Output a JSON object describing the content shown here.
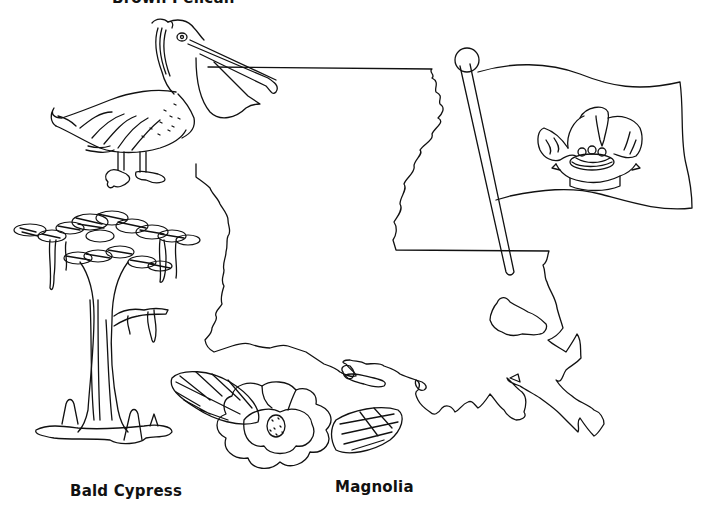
{
  "labels": {
    "bird": "Brown Pelican",
    "tree": "Bald Cypress",
    "flower": "Magnolia"
  },
  "illustrations": [
    {
      "name": "brown-pelican",
      "description": "Line drawing of a standing brown pelican with long bill"
    },
    {
      "name": "louisiana-map",
      "description": "Outline map of the state of Louisiana"
    },
    {
      "name": "state-flag",
      "description": "Waving flag on a pole with pelican feeding chicks in nest above ribbon"
    },
    {
      "name": "bald-cypress",
      "description": "Cypress tree with hanging moss and knees in water"
    },
    {
      "name": "magnolia",
      "description": "Magnolia blossom flanked by two hatched leaves"
    }
  ],
  "colors": {
    "ink": "#111111",
    "paper": "#ffffff"
  }
}
